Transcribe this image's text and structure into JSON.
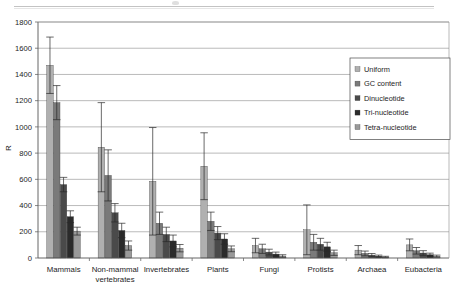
{
  "chart_data": {
    "type": "bar",
    "title": "",
    "xlabel": "",
    "ylabel": "R",
    "ylim": [
      0,
      1800
    ],
    "ytick_step": 200,
    "yticks": [
      0,
      200,
      400,
      600,
      800,
      1000,
      1200,
      1400,
      1600,
      1800
    ],
    "grid": true,
    "grid_axis": "y",
    "legend_position": "upper-right-inside",
    "orientation": "vertical",
    "error_bars": true,
    "categories": [
      "Mammals",
      "Non-mammal vertebrates",
      "Invertebrates",
      "Plants",
      "Fungi",
      "Protists",
      "Archaea",
      "Eubacteria"
    ],
    "series": [
      {
        "name": "Uniform",
        "color": "#b0b0b0",
        "values": [
          1470,
          845,
          585,
          700,
          95,
          215,
          60,
          100
        ],
        "errors": [
          215,
          340,
          410,
          255,
          55,
          190,
          35,
          45
        ]
      },
      {
        "name": "GC content",
        "color": "#7a7a7a",
        "values": [
          1185,
          630,
          265,
          280,
          70,
          120,
          35,
          55
        ],
        "errors": [
          130,
          195,
          85,
          70,
          35,
          60,
          18,
          25
        ]
      },
      {
        "name": "Dinucleotide",
        "color": "#4a4a4a",
        "values": [
          560,
          345,
          180,
          190,
          45,
          105,
          22,
          38
        ],
        "errors": [
          55,
          70,
          55,
          50,
          22,
          45,
          12,
          18
        ]
      },
      {
        "name": "Tri-nucleotide",
        "color": "#2b2b2b",
        "values": [
          315,
          210,
          130,
          145,
          30,
          85,
          14,
          25
        ],
        "errors": [
          45,
          55,
          45,
          40,
          15,
          35,
          8,
          12
        ]
      },
      {
        "name": "Tetra-nucleotide",
        "color": "#9a9a9a",
        "values": [
          205,
          95,
          75,
          70,
          15,
          40,
          8,
          14
        ],
        "errors": [
          30,
          35,
          28,
          22,
          10,
          20,
          5,
          8
        ]
      }
    ]
  },
  "axis": {
    "y_title": "R"
  }
}
